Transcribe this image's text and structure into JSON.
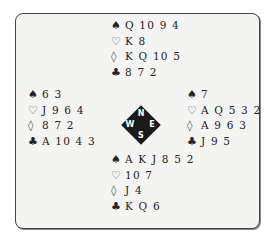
{
  "suits": {
    "spades": "♠",
    "hearts": "♡",
    "diamonds": "◊",
    "clubs": "♣"
  },
  "hands": {
    "north": {
      "spades": "Q 10 9 4",
      "hearts": "K 8",
      "diamonds": "K Q 10 5",
      "clubs": "8 7 2"
    },
    "west": {
      "spades": "6 3",
      "hearts": "J 9 6 4",
      "diamonds": "8 7 2",
      "clubs": "A 10 4 3"
    },
    "east": {
      "spades": "7",
      "hearts": "A Q 5 3 2",
      "diamonds": "A 9 6 3",
      "clubs": "J 9 5"
    },
    "south": {
      "spades": "A K J 8 5 2",
      "hearts": "10 7",
      "diamonds": "J 4",
      "clubs": "K Q 6"
    }
  },
  "compass": {
    "north": "N",
    "south": "S",
    "west": "W",
    "east": "E"
  }
}
